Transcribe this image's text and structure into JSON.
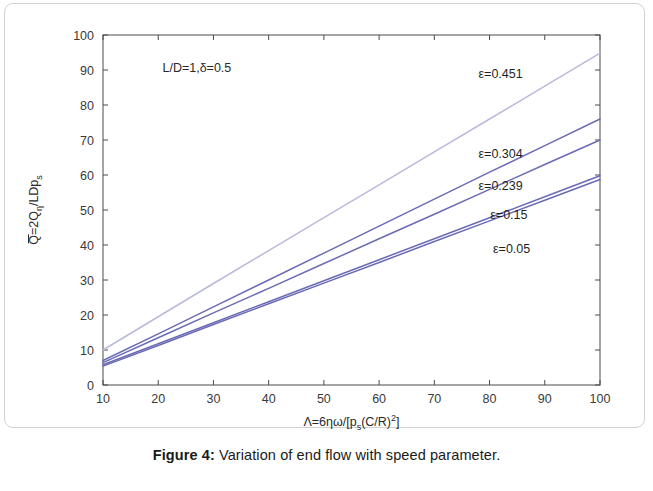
{
  "caption": {
    "number": "Figure 4:",
    "text": " Variation of end flow with speed parameter."
  },
  "annotation": {
    "text": "L/D=1,δ=0.5"
  },
  "chart_data": {
    "type": "line",
    "title": "",
    "xlabel": "Λ=6ηω/[p",
    "xlabel_parts": {
      "pre": "Λ=6ηω/[p",
      "sub": "s",
      "mid": "(C/R)",
      "sup": "2",
      "post": "]"
    },
    "ylabel_parts": {
      "pre": "Q=2Q",
      "sub1": "η",
      "mid": "/LDp",
      "sub2": "s"
    },
    "xlim": [
      10,
      100
    ],
    "ylim": [
      0,
      100
    ],
    "xticks": [
      10,
      20,
      30,
      40,
      50,
      60,
      70,
      80,
      90,
      100
    ],
    "yticks": [
      0,
      10,
      20,
      30,
      40,
      50,
      60,
      70,
      80,
      90,
      100
    ],
    "xticklabels": [
      "10",
      "20",
      "30",
      "40",
      "50",
      "60",
      "70",
      "80",
      "90",
      "100"
    ],
    "yticklabels": [
      "0",
      "10",
      "20",
      "30",
      "40",
      "50",
      "60",
      "70",
      "80",
      "90",
      "100"
    ],
    "grid": false,
    "legend_position": "inline-right-of-curves",
    "colors": {
      "curve_primary": "#6b6bb5",
      "curve_faded": "#b9b9dd",
      "axis": "#4a4a4a",
      "text": "#1f1f1f"
    },
    "x": [
      10,
      20,
      30,
      40,
      50,
      60,
      70,
      80,
      90,
      100
    ],
    "series": [
      {
        "name": "ε=0.451",
        "label": "ε=0.451",
        "color": "#b9b9dd",
        "values": [
          10.0,
          19.5,
          29.0,
          38.4,
          47.8,
          57.2,
          66.6,
          76.0,
          85.4,
          94.8
        ]
      },
      {
        "name": "ε=0.304",
        "label": "ε=0.304",
        "color": "#6b6bb5",
        "values": [
          7.0,
          14.6,
          22.3,
          30.0,
          37.7,
          45.4,
          53.1,
          60.8,
          68.4,
          76.0
        ]
      },
      {
        "name": "ε=0.239",
        "label": "ε=0.239",
        "color": "#6b6bb5",
        "values": [
          6.4,
          13.5,
          20.6,
          27.6,
          34.7,
          41.8,
          48.8,
          55.9,
          63.0,
          70.0
        ]
      },
      {
        "name": "ε=0.15",
        "label": "ε=0.15",
        "color": "#6b6bb5",
        "values": [
          5.8,
          11.8,
          17.8,
          23.8,
          29.8,
          35.8,
          41.8,
          47.8,
          53.8,
          59.8
        ]
      },
      {
        "name": "ε=0.05",
        "label": "ε=0.05",
        "color": "#6b6bb5",
        "values": [
          5.4,
          11.3,
          17.3,
          23.2,
          29.1,
          35.0,
          41.0,
          46.9,
          52.8,
          58.7
        ]
      }
    ],
    "curve_labels": [
      {
        "text": "ε=0.451",
        "x": 82.0,
        "y": 89.0
      },
      {
        "text": "ε=0.304",
        "x": 82.0,
        "y": 66.0
      },
      {
        "text": "ε=0.239",
        "x": 82.0,
        "y": 57.0
      },
      {
        "text": "ε=0.15",
        "x": 83.5,
        "y": 48.5
      },
      {
        "text": "ε=0.05",
        "x": 84.0,
        "y": 39.0
      }
    ],
    "annotation_point": {
      "text": "L/D=1,δ=0.5",
      "x": 27.0,
      "y": 90.5
    }
  }
}
